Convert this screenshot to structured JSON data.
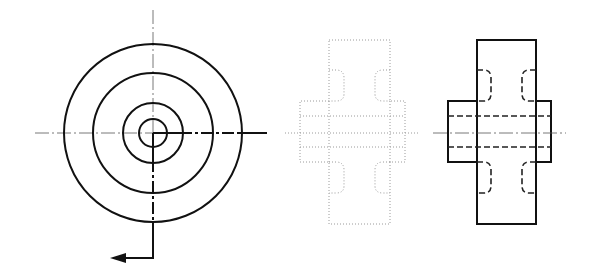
{
  "drawing": {
    "type": "orthographic-views",
    "subject": "flanged hub / coupling with relief grooves",
    "colors": {
      "line": "#111111",
      "center_line": "#555555",
      "ghost_line": "#9a9a9a",
      "background": "#ffffff"
    },
    "front_view": {
      "center": [
        153,
        133
      ],
      "circles_r": [
        89,
        60,
        30,
        14
      ],
      "cut_path": "M153,133 L267,133 M153,133 L153,258 L112,258",
      "arrow": [
        [
          112,
          258
        ],
        [
          124,
          254
        ],
        [
          124,
          262
        ]
      ]
    },
    "ghost_side_view": {
      "body": [
        329,
        40,
        61,
        184
      ],
      "hub": [
        300,
        101,
        105,
        61
      ],
      "bore_lines_y": [
        116,
        147
      ],
      "axis": [
        285,
        133,
        420,
        133
      ]
    },
    "section_side_view": {
      "body": [
        477,
        40,
        59,
        184
      ],
      "hub": [
        448,
        101,
        103,
        61
      ],
      "bore_lines_y": [
        116,
        147
      ],
      "axis": [
        433,
        133,
        566,
        133
      ]
    }
  }
}
